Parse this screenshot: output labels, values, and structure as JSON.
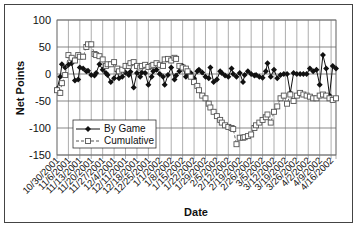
{
  "chart_data": {
    "type": "line",
    "title": "",
    "xlabel": "Date",
    "ylabel": "Net Points",
    "ylim": [
      -150,
      100
    ],
    "yticks": [
      100,
      50,
      0,
      -50,
      -100,
      -150
    ],
    "ytick_labels": [
      "100",
      "50",
      "0",
      "-50",
      "-100",
      "-150"
    ],
    "grid": true,
    "legend_position": "lower-left",
    "x_tick_labels": [
      "10/30/2001",
      "11/6/2001",
      "11/13/2001",
      "11/20/2001",
      "11/27/2001",
      "12/4/2001",
      "12/11/2001",
      "12/18/2001",
      "12/25/2001",
      "1/1/2002",
      "1/8/2002",
      "1/15/2002",
      "1/22/2002",
      "1/29/2002",
      "2/5/2002",
      "2/12/2002",
      "2/19/2002",
      "2/26/2002",
      "3/5/2002",
      "3/12/2002",
      "3/19/2002",
      "3/26/2002",
      "4/2/2002",
      "4/9/2002",
      "4/16/2002"
    ],
    "x_day_range": [
      0,
      171
    ],
    "x_note": "x values are days since 10/30/2001",
    "series": [
      {
        "name": "By Game",
        "marker": "diamond",
        "line": "solid",
        "color": "#111111",
        "x": [
          0,
          2,
          3,
          5,
          7,
          9,
          11,
          13,
          14,
          16,
          18,
          19,
          21,
          23,
          24,
          26,
          28,
          30,
          31,
          33,
          35,
          37,
          38,
          40,
          42,
          44,
          45,
          47,
          49,
          51,
          52,
          54,
          56,
          58,
          59,
          61,
          63,
          65,
          66,
          68,
          70,
          72,
          73,
          75,
          77,
          79,
          80,
          82,
          84,
          86,
          87,
          89,
          91,
          93,
          94,
          96,
          98,
          100,
          101,
          103,
          105,
          107,
          108,
          110,
          112,
          114,
          115,
          117,
          119,
          121,
          122,
          124,
          126,
          128,
          129,
          131,
          133,
          135,
          137,
          139,
          141,
          143,
          145,
          147,
          149,
          151,
          153,
          155,
          157,
          159,
          161,
          163,
          165,
          167,
          169,
          171
        ],
        "y": [
          -28,
          -5,
          18,
          12,
          17,
          20,
          -12,
          -10,
          12,
          10,
          5,
          6,
          -2,
          -3,
          2,
          18,
          8,
          2,
          -2,
          -15,
          -8,
          5,
          -8,
          -5,
          3,
          -2,
          4,
          -25,
          2,
          -5,
          3,
          2,
          -20,
          -5,
          5,
          8,
          0,
          -5,
          -20,
          -2,
          12,
          -10,
          -3,
          5,
          15,
          -5,
          0,
          2,
          -8,
          5,
          8,
          3,
          -5,
          -8,
          12,
          -15,
          -10,
          5,
          2,
          -3,
          -5,
          10,
          0,
          -5,
          2,
          -15,
          -2,
          5,
          0,
          -3,
          -2,
          -5,
          -7,
          5,
          20,
          -5,
          8,
          -8,
          -2,
          0,
          0,
          -35,
          2,
          0,
          0,
          0,
          0,
          10,
          5,
          8,
          -20,
          35,
          10,
          -40,
          15,
          10
        ]
      },
      {
        "name": "Cumulative",
        "marker": "square",
        "line": "dashed",
        "color": "#555555",
        "x": [
          0,
          2,
          3,
          5,
          7,
          9,
          11,
          13,
          14,
          16,
          18,
          19,
          21,
          23,
          24,
          26,
          28,
          30,
          31,
          33,
          35,
          37,
          38,
          40,
          42,
          44,
          45,
          47,
          49,
          51,
          52,
          54,
          56,
          58,
          59,
          61,
          63,
          65,
          66,
          68,
          70,
          72,
          73,
          75,
          77,
          79,
          80,
          82,
          84,
          86,
          87,
          89,
          91,
          93,
          94,
          96,
          98,
          100,
          101,
          103,
          105,
          107,
          108,
          110,
          112,
          114,
          115,
          117,
          119,
          121,
          122,
          124,
          126,
          128,
          129,
          131,
          133,
          135,
          137,
          139,
          141,
          143,
          145,
          147,
          149,
          151,
          153,
          155,
          157,
          159,
          161,
          163,
          165,
          167,
          169,
          171
        ],
        "y": [
          -30,
          -35,
          -17,
          -2,
          35,
          30,
          25,
          35,
          32,
          32,
          50,
          55,
          55,
          37,
          35,
          33,
          27,
          15,
          18,
          18,
          22,
          10,
          5,
          8,
          15,
          15,
          20,
          22,
          15,
          12,
          15,
          17,
          13,
          15,
          17,
          20,
          17,
          15,
          27,
          28,
          25,
          30,
          28,
          15,
          12,
          10,
          5,
          -5,
          -15,
          -22,
          -30,
          -40,
          -45,
          -55,
          -62,
          -70,
          -78,
          -85,
          -90,
          -95,
          -98,
          -100,
          -102,
          -130,
          -118,
          -118,
          -117,
          -115,
          -112,
          -100,
          -95,
          -90,
          -85,
          -80,
          -75,
          -90,
          -70,
          -60,
          -45,
          -40,
          -55,
          -38,
          -50,
          -40,
          -35,
          -38,
          -40,
          -42,
          -45,
          -45,
          -40,
          -38,
          -40,
          -45,
          -48,
          -45
        ]
      }
    ]
  }
}
